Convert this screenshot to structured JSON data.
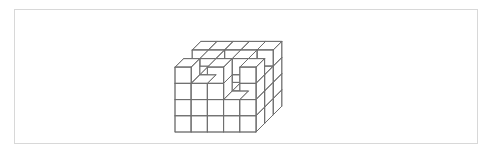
{
  "page": {
    "background_color": "#ffffff",
    "width": 494,
    "height": 157
  },
  "figure_box": {
    "border_color": "#d8d8d8",
    "background_color": "#ffffff",
    "x": 14,
    "y": 9,
    "width": 464,
    "height": 135
  },
  "figure": {
    "name": "cube-stack-isometric",
    "title": "",
    "line_color": "#6e6e6e",
    "face_color": "#ffffff",
    "line_width": 0.7,
    "projection": {
      "type": "isometric-cabinet",
      "cube_face_px": 16.2,
      "depth_dx_px": 8.6,
      "depth_dy_px": -8.6,
      "origin_x_px": 175,
      "origin_y_px": 132
    },
    "grid": {
      "columns_x": 5,
      "rows_z_depth": 3,
      "levels_y_height": 4,
      "total_cells": 60,
      "cubes_present": 47
    },
    "heightmap_note": "heights[z][x] = number of stacked cubes at depth-row z, column x; z=0 is the front row, x=0 is the left column",
    "heights": [
      [
        4,
        3,
        4,
        2,
        4
      ],
      [
        3,
        4,
        2,
        4,
        3
      ],
      [
        4,
        4,
        4,
        4,
        4
      ]
    ]
  }
}
